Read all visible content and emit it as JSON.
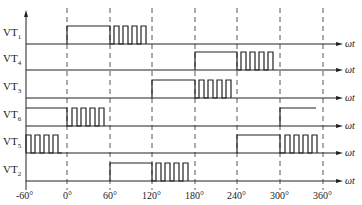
{
  "diagram": {
    "title": "",
    "x_axis": {
      "variable": "ωt",
      "ticks": [
        "-60°",
        "0°",
        "60°",
        "120°",
        "180°",
        "240°",
        "300°",
        "360°"
      ],
      "tick_values": [
        -60,
        0,
        60,
        120,
        180,
        240,
        300,
        360
      ]
    },
    "signals": [
      {
        "name": "VT",
        "sub": "1",
        "axis_label": "ωt",
        "high_continuous": [
          0,
          60
        ],
        "chopped": [
          60,
          120
        ]
      },
      {
        "name": "VT",
        "sub": "4",
        "axis_label": "ωt",
        "high_continuous": [
          180,
          240
        ],
        "chopped": [
          240,
          300
        ]
      },
      {
        "name": "VT",
        "sub": "3",
        "axis_label": "ωt",
        "high_continuous": [
          120,
          180
        ],
        "chopped": [
          180,
          240
        ]
      },
      {
        "name": "VT",
        "sub": "6",
        "axis_label": "ωt",
        "high_continuous": [
          300,
          360
        ],
        "chopped": [
          0,
          60
        ],
        "also_high": [
          -60,
          0
        ]
      },
      {
        "name": "VT",
        "sub": "5",
        "axis_label": "ωt",
        "high_continuous": [
          240,
          300
        ],
        "chopped": [
          300,
          360
        ],
        "also_chopped": [
          -60,
          0
        ]
      },
      {
        "name": "VT",
        "sub": "2",
        "axis_label": "ωt",
        "high_continuous": [
          60,
          120
        ],
        "chopped": [
          120,
          180
        ]
      }
    ],
    "line_color": "#222222",
    "dash_color": "#444444"
  }
}
